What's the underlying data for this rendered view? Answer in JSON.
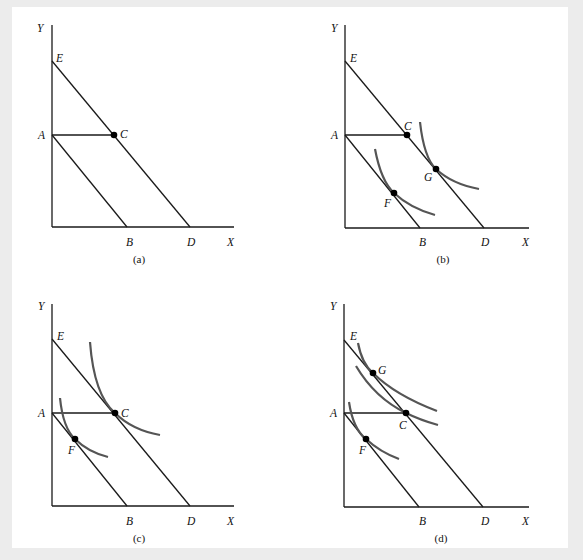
{
  "figure": {
    "panels": [
      {
        "id": "a",
        "caption": "(a)",
        "axes": {
          "x": "X",
          "y": "Y"
        },
        "points": {
          "E": "E",
          "A": "A",
          "B": "B",
          "D": "D",
          "C": "C"
        },
        "budget_lines": [
          "AB",
          "ED"
        ],
        "segments": [
          "AC"
        ],
        "dots": [
          "C"
        ],
        "indifference_curves": []
      },
      {
        "id": "b",
        "caption": "(b)",
        "axes": {
          "x": "X",
          "y": "Y"
        },
        "points": {
          "E": "E",
          "A": "A",
          "B": "B",
          "D": "D",
          "C": "C",
          "F": "F",
          "G": "G"
        },
        "budget_lines": [
          "AB",
          "ED"
        ],
        "segments": [
          "AC"
        ],
        "dots": [
          "C",
          "F",
          "G"
        ],
        "indifference_curves": [
          "through F",
          "through G"
        ]
      },
      {
        "id": "c",
        "caption": "(c)",
        "axes": {
          "x": "X",
          "y": "Y"
        },
        "points": {
          "E": "E",
          "A": "A",
          "B": "B",
          "D": "D",
          "C": "C",
          "F": "F"
        },
        "budget_lines": [
          "AB",
          "ED"
        ],
        "segments": [
          "AC"
        ],
        "dots": [
          "C",
          "F"
        ],
        "indifference_curves": [
          "through C",
          "through F"
        ]
      },
      {
        "id": "d",
        "caption": "(d)",
        "axes": {
          "x": "X",
          "y": "Y"
        },
        "points": {
          "E": "E",
          "A": "A",
          "B": "B",
          "D": "D",
          "C": "C",
          "F": "F",
          "G": "G"
        },
        "budget_lines": [
          "AB",
          "ED"
        ],
        "segments": [
          "AC"
        ],
        "dots": [
          "C",
          "F",
          "G"
        ],
        "indifference_curves": [
          "through G",
          "through C",
          "through F"
        ]
      }
    ]
  }
}
